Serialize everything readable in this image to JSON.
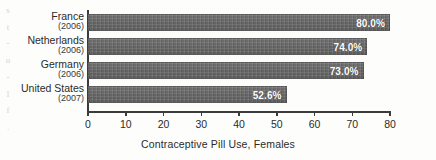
{
  "chart_data": {
    "type": "bar",
    "orientation": "horizontal",
    "title": "",
    "xlabel": "Contraceptive Pill Use, Females",
    "ylabel": "",
    "xlim": [
      0,
      80
    ],
    "xticks": [
      0,
      10,
      20,
      30,
      40,
      50,
      60,
      70,
      80
    ],
    "xtick_labels": [
      "0",
      "10",
      "20",
      "30",
      "40",
      "50",
      "60",
      "70",
      "80"
    ],
    "grid": false,
    "legend": false,
    "categories": [
      "France",
      "Netherlands",
      "Germany",
      "United States"
    ],
    "category_years": [
      "(2006)",
      "(2006)",
      "(2006)",
      "(2007)"
    ],
    "values": [
      80.0,
      74.0,
      73.0,
      52.6
    ],
    "value_labels": [
      "80.0%",
      "74.0%",
      "73.0%",
      "52.6%"
    ],
    "bars": [
      {
        "category": "France",
        "year": "(2006)",
        "value": 80.0,
        "label": "80.0%"
      },
      {
        "category": "Netherlands",
        "year": "(2006)",
        "value": 74.0,
        "label": "74.0%"
      },
      {
        "category": "Germany",
        "year": "(2006)",
        "value": 73.0,
        "label": "73.0%"
      },
      {
        "category": "United States",
        "year": "(2007)",
        "value": 52.6,
        "label": "52.6%"
      }
    ],
    "colors": {
      "bar_fill": "#6e6e6e",
      "value_label": "#ffffff",
      "axis": "#3b3b3b",
      "text": "#2b2b2b",
      "background": "#fdfdfc"
    }
  },
  "margin_fragments": [
    "s",
    "t",
    "-",
    "o",
    "-",
    "l",
    "f",
    "."
  ]
}
